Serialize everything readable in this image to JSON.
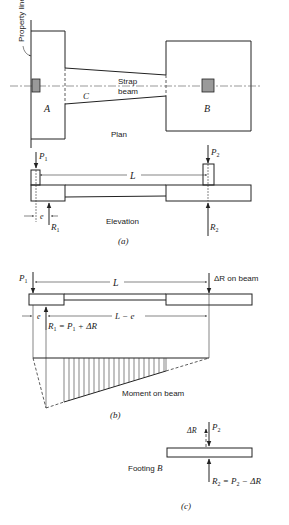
{
  "figure": {
    "plan": {
      "property_line_label": "Property line",
      "footing_a_label": "A",
      "footing_b_label": "B",
      "strap_label_line1": "Strap",
      "strap_label_line2": "beam",
      "strap_section_label": "C",
      "view_label": "Plan"
    },
    "elevation": {
      "p1_label": "P",
      "p1_sub": "1",
      "p2_label": "P",
      "p2_sub": "2",
      "r1_label": "R",
      "r1_sub": "1",
      "r2_label": "R",
      "r2_sub": "2",
      "span_label": "L",
      "eccentricity_label": "e",
      "view_label": "Elevation",
      "caption": "(a)"
    },
    "beam_analysis": {
      "p1_label": "P",
      "p1_sub": "1",
      "span_label": "L",
      "delta_r_label": "ΔR on beam",
      "eccentricity_label": "e",
      "l_minus_e_label": "L − e",
      "r1_eq_prefix": "R",
      "r1_eq_sub": "1",
      "r1_eq_rest": " = P",
      "r1_eq_sub2": "1",
      "r1_eq_tail": " + ΔR",
      "moment_label": "Moment on beam",
      "caption": "(b)"
    },
    "footing_b": {
      "delta_r_label": "ΔR",
      "p2_label": "P",
      "p2_sub": "2",
      "footing_label_prefix": "Footing ",
      "footing_label_letter": "B",
      "r2_eq_prefix": "R",
      "r2_eq_sub": "2",
      "r2_eq_rest": " = P",
      "r2_eq_sub2": "2",
      "r2_eq_tail": " − ΔR",
      "caption": "(c)"
    }
  }
}
